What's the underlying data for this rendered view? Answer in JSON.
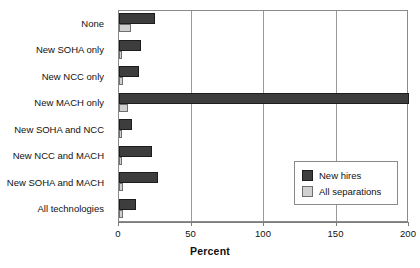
{
  "chart_data": {
    "type": "bar",
    "orientation": "horizontal",
    "title": "",
    "xlabel": "Percent",
    "ylabel": "",
    "xlim": [
      0,
      200
    ],
    "xticks": [
      0,
      50,
      100,
      150,
      200
    ],
    "xtick_labels": [
      "0",
      "50",
      "100",
      "150",
      "200"
    ],
    "grid": "vertical",
    "legend_position": "inside-right",
    "categories": [
      "None",
      "New SOHA only",
      "New NCC only",
      "New MACH only",
      "New SOHA and NCC",
      "New NCC and MACH",
      "New SOHA and MACH",
      "All technologies"
    ],
    "series": [
      {
        "name": "New hires",
        "color": "#3d3d3d",
        "values": [
          25,
          15,
          14,
          200,
          9,
          23,
          27,
          12
        ]
      },
      {
        "name": "All separations",
        "color": "#d0d0d0",
        "values": [
          8,
          2,
          3,
          6,
          1,
          1,
          3,
          3
        ]
      }
    ]
  },
  "legend": {
    "items": [
      {
        "label": "New hires",
        "swatch": "dark"
      },
      {
        "label": "All separations",
        "swatch": "light"
      }
    ]
  },
  "axis": {
    "x_title": "Percent"
  }
}
